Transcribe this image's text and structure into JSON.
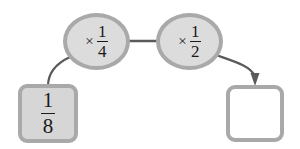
{
  "diagram": {
    "type": "function-machine-flow",
    "background_color": "#ffffff",
    "stroke_color": "#a9a9a9",
    "text_color": "#1a1a1a",
    "start_node": {
      "label": "1/8",
      "numerator": "1",
      "denominator": "8",
      "fill_color": "#d6d6d6",
      "border_color": "#a9a9a9"
    },
    "operations": [
      {
        "label": "× 1/4",
        "operator": "×",
        "numerator": "1",
        "denominator": "4",
        "fill_color": "#dcdcdc",
        "border_color": "#a9a9a9"
      },
      {
        "label": "× 1/2",
        "operator": "×",
        "numerator": "1",
        "denominator": "2",
        "fill_color": "#dcdcdc",
        "border_color": "#a9a9a9"
      }
    ],
    "result_node": {
      "label": "",
      "fill_color": "#ffffff",
      "border_color": "#a9a9a9",
      "is_blank": true
    },
    "connectors": [
      {
        "name": "start-to-op1",
        "style": "curve",
        "arrowhead": false
      },
      {
        "name": "op1-to-op2",
        "style": "straight",
        "arrowhead": false
      },
      {
        "name": "op2-to-result",
        "style": "curve",
        "arrowhead": true
      }
    ]
  }
}
